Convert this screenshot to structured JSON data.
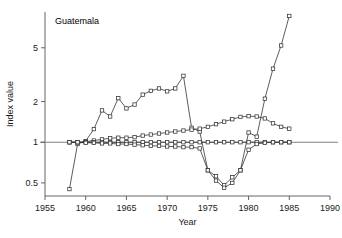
{
  "chart_data": {
    "type": "line",
    "title": "Guatemala",
    "xlabel": "Year",
    "ylabel": "Index value",
    "yscale": "log",
    "xlim": [
      1955,
      1990
    ],
    "ylim": [
      0.4,
      9.2
    ],
    "xticks": [
      1955,
      1960,
      1965,
      1970,
      1975,
      1980,
      1985,
      1990
    ],
    "xticklabels": [
      "1955",
      "1960",
      "1965",
      "1970",
      "1975",
      "1980",
      "1985",
      "1990"
    ],
    "yticks": [
      0.5,
      1,
      2,
      5
    ],
    "yticklabels": [
      "0.5",
      "1",
      "2",
      "5"
    ],
    "grid": false,
    "legend": "none",
    "reference_line": {
      "y": 1,
      "color": "#808080"
    },
    "marker": "open-square",
    "line_color": "#333333",
    "series": [
      {
        "name": "series-steep-rise",
        "x": [
          1958,
          1959,
          1960,
          1961,
          1962,
          1963,
          1964,
          1965,
          1966,
          1967,
          1968,
          1969,
          1970,
          1971,
          1972,
          1973,
          1974,
          1975,
          1976,
          1977,
          1978,
          1979,
          1980,
          1981,
          1982,
          1983,
          1984,
          1985
        ],
        "values": [
          0.45,
          0.97,
          1.02,
          1.25,
          1.72,
          1.55,
          2.12,
          1.78,
          1.9,
          2.25,
          2.4,
          2.5,
          2.38,
          2.5,
          3.1,
          1.28,
          1.2,
          0.62,
          0.56,
          0.48,
          0.55,
          0.62,
          1.18,
          1.1,
          2.1,
          3.5,
          5.2,
          8.6
        ]
      },
      {
        "name": "series-moderate-rise",
        "x": [
          1958,
          1959,
          1960,
          1961,
          1962,
          1963,
          1964,
          1965,
          1966,
          1967,
          1968,
          1969,
          1970,
          1971,
          1972,
          1973,
          1974,
          1975,
          1976,
          1977,
          1978,
          1979,
          1980,
          1981,
          1982,
          1983,
          1984,
          1985
        ],
        "values": [
          1.0,
          1.0,
          1.01,
          1.03,
          1.05,
          1.07,
          1.08,
          1.08,
          1.09,
          1.12,
          1.14,
          1.16,
          1.18,
          1.2,
          1.22,
          1.24,
          1.26,
          1.3,
          1.36,
          1.42,
          1.48,
          1.54,
          1.56,
          1.55,
          1.5,
          1.38,
          1.3,
          1.26
        ]
      },
      {
        "name": "series-flat-unity",
        "x": [
          1958,
          1959,
          1960,
          1961,
          1962,
          1963,
          1964,
          1965,
          1966,
          1967,
          1968,
          1969,
          1970,
          1971,
          1972,
          1973,
          1974,
          1975,
          1976,
          1977,
          1978,
          1979,
          1980,
          1981,
          1982,
          1983,
          1984,
          1985
        ],
        "values": [
          1.0,
          1.0,
          1.0,
          1.0,
          1.0,
          1.0,
          1.0,
          1.0,
          1.0,
          1.0,
          1.0,
          1.0,
          1.0,
          1.0,
          1.0,
          1.0,
          1.0,
          1.0,
          1.0,
          1.0,
          1.0,
          1.0,
          1.0,
          1.0,
          1.0,
          1.0,
          1.0,
          1.0
        ]
      },
      {
        "name": "series-dip",
        "x": [
          1958,
          1959,
          1960,
          1961,
          1962,
          1963,
          1964,
          1965,
          1966,
          1967,
          1968,
          1969,
          1970,
          1971,
          1972,
          1973,
          1974,
          1975,
          1976,
          1977,
          1978,
          1979,
          1980,
          1981,
          1982,
          1983,
          1984,
          1985
        ],
        "values": [
          1.0,
          1.0,
          0.99,
          0.99,
          0.98,
          0.98,
          0.97,
          0.97,
          0.96,
          0.95,
          0.94,
          0.94,
          0.93,
          0.93,
          0.92,
          0.92,
          0.9,
          0.62,
          0.52,
          0.46,
          0.5,
          0.62,
          0.88,
          0.97,
          0.99,
          1.0,
          1.0,
          1.0
        ]
      }
    ]
  }
}
